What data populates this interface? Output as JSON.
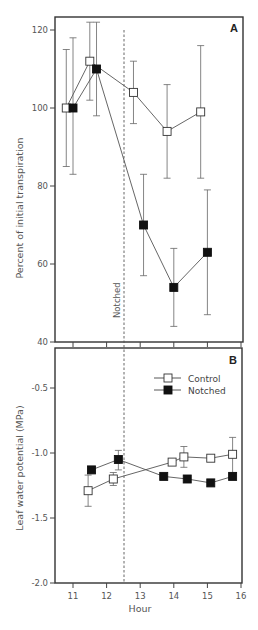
{
  "chart_data": [
    {
      "panel": "A",
      "type": "line",
      "title": "",
      "panel_label": "A",
      "xlabel": "",
      "ylabel": "Percent of initial transpiration",
      "ylim": [
        40,
        124
      ],
      "xlim": [
        10.5,
        16
      ],
      "yticks": [
        40,
        60,
        80,
        100,
        120
      ],
      "xticks": [
        11,
        12,
        13,
        14,
        15,
        16
      ],
      "grid": false,
      "annotations": [
        {
          "text": "Notched",
          "x": 12.5,
          "type": "vertical-dashed-line"
        }
      ],
      "series": [
        {
          "name": "Control",
          "marker": "open-square",
          "points": [
            {
              "x": 10.8,
              "y": 100,
              "err_low": 85,
              "err_high": 115
            },
            {
              "x": 11.5,
              "y": 112,
              "err_low": 102,
              "err_high": 122
            },
            {
              "x": 12.8,
              "y": 104,
              "err_low": 96,
              "err_high": 112
            },
            {
              "x": 13.8,
              "y": 94,
              "err_low": 82,
              "err_high": 106
            },
            {
              "x": 14.8,
              "y": 99,
              "err_low": 82,
              "err_high": 116
            }
          ]
        },
        {
          "name": "Notched",
          "marker": "filled-square",
          "points": [
            {
              "x": 11.0,
              "y": 100,
              "err_low": 83,
              "err_high": 118
            },
            {
              "x": 11.7,
              "y": 110,
              "err_low": 98,
              "err_high": 122
            },
            {
              "x": 13.1,
              "y": 70,
              "err_low": 57,
              "err_high": 83
            },
            {
              "x": 14.0,
              "y": 54,
              "err_low": 44,
              "err_high": 64
            },
            {
              "x": 15.0,
              "y": 63,
              "err_low": 47,
              "err_high": 79
            }
          ]
        }
      ]
    },
    {
      "panel": "B",
      "type": "line",
      "title": "",
      "panel_label": "B",
      "xlabel": "Hour",
      "ylabel": "Leaf water potential (MPa)",
      "ylim": [
        -2.0,
        -0.2
      ],
      "xlim": [
        10.5,
        16
      ],
      "yticks": [
        -2.0,
        -1.5,
        -1.0,
        -0.5
      ],
      "xticks": [
        11,
        12,
        13,
        14,
        15,
        16
      ],
      "grid": false,
      "legend_position": "upper right",
      "legend": [
        "Control",
        "Notched"
      ],
      "annotations": [
        {
          "text": "",
          "x": 12.5,
          "type": "vertical-dashed-line"
        }
      ],
      "series": [
        {
          "name": "Control",
          "marker": "open-square",
          "points": [
            {
              "x": 11.45,
              "y": -1.29,
              "err_low": -1.41,
              "err_high": -1.17
            },
            {
              "x": 12.2,
              "y": -1.2,
              "err_low": -1.25,
              "err_high": -1.15
            },
            {
              "x": 13.95,
              "y": -1.07,
              "err_low": null,
              "err_high": null
            },
            {
              "x": 14.3,
              "y": -1.03,
              "err_low": -1.11,
              "err_high": -0.95
            },
            {
              "x": 15.1,
              "y": -1.04,
              "err_low": null,
              "err_high": null
            },
            {
              "x": 15.75,
              "y": -1.01,
              "err_low": -1.15,
              "err_high": -0.88
            }
          ]
        },
        {
          "name": "Notched",
          "marker": "filled-square",
          "points": [
            {
              "x": 11.55,
              "y": -1.13,
              "err_low": null,
              "err_high": null
            },
            {
              "x": 12.35,
              "y": -1.05,
              "err_low": -1.13,
              "err_high": -0.98
            },
            {
              "x": 13.7,
              "y": -1.18,
              "err_low": null,
              "err_high": null
            },
            {
              "x": 14.4,
              "y": -1.2,
              "err_low": null,
              "err_high": null
            },
            {
              "x": 15.1,
              "y": -1.23,
              "err_low": null,
              "err_high": null
            },
            {
              "x": 15.75,
              "y": -1.18,
              "err_low": null,
              "err_high": null
            }
          ]
        }
      ]
    }
  ],
  "labels": {
    "panel_a": "A",
    "panel_b": "B",
    "ylabel_a": "Percent of initial transpiration",
    "ylabel_b": "Leaf water potential (MPa)",
    "xlabel": "Hour",
    "notched_annotation": "Notched",
    "legend_control": "Control",
    "legend_notched": "Notched"
  }
}
